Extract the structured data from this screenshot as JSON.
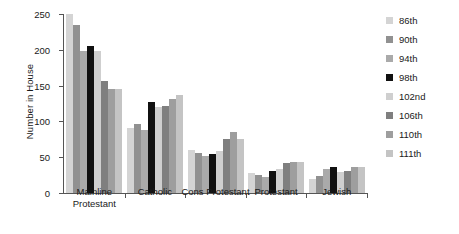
{
  "chart_data": {
    "type": "bar",
    "title": "",
    "subtitle": "",
    "xlabel": "",
    "ylabel": "Number in House",
    "ylim": [
      0,
      250
    ],
    "ytick_values": [
      0,
      50,
      100,
      150,
      200,
      250
    ],
    "ytick_labels": [
      "0",
      "50",
      "100",
      "150",
      "200",
      "250"
    ],
    "grid": false,
    "legend_position": "right",
    "categories": [
      "Mainline\nProtestant",
      "Catholic",
      "Cons Protestant",
      "Protestant",
      "Jewish"
    ],
    "series": [
      {
        "name": "86th",
        "color": "#d4d4d4",
        "values": [
          250,
          91,
          60,
          28,
          20
        ]
      },
      {
        "name": "90th",
        "color": "#919191",
        "values": [
          235,
          96,
          56,
          25,
          24
        ]
      },
      {
        "name": "94th",
        "color": "#aaaaaa",
        "values": [
          199,
          88,
          52,
          22,
          34
        ]
      },
      {
        "name": "98th",
        "color": "#111111",
        "values": [
          205,
          127,
          54,
          31,
          36
        ]
      },
      {
        "name": "102nd",
        "color": "#cfcfcf",
        "values": [
          198,
          120,
          58,
          33,
          30
        ]
      },
      {
        "name": "106th",
        "color": "#7f7f7f",
        "values": [
          157,
          121,
          76,
          42,
          31
        ]
      },
      {
        "name": "110th",
        "color": "#9e9e9e",
        "values": [
          145,
          132,
          85,
          43,
          36
        ]
      },
      {
        "name": "111th",
        "color": "#c4c4c4",
        "values": [
          145,
          137,
          75,
          43,
          37
        ]
      }
    ]
  },
  "axis": {
    "y_title": "Number in House"
  },
  "colors": {
    "axis": "#555555",
    "text": "#1a1a1a",
    "background": "#ffffff"
  }
}
